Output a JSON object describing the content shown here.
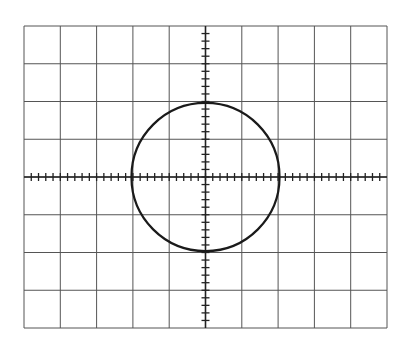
{
  "diagram": {
    "graticule": {
      "columns": 10,
      "rows": 8,
      "subdivisions_per_division": 5,
      "left": 24,
      "top": 26,
      "right": 387,
      "bottom": 328,
      "grid_color": "#555555",
      "axis_color": "#222222"
    },
    "trace": {
      "shape": "circle",
      "center_div": [
        0,
        0
      ],
      "radius_div": 2,
      "color": "#1a1a1a"
    }
  }
}
